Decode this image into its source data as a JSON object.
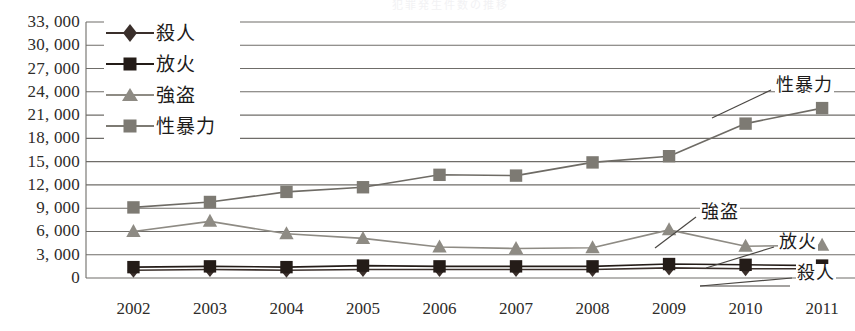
{
  "title_faint": "犯罪発生件数の推移",
  "chart_data": {
    "type": "line",
    "title": "",
    "xlabel": "",
    "ylabel": "",
    "ylim": [
      0,
      33000
    ],
    "ytick_step": 3000,
    "grid": true,
    "legend_position": "top-left",
    "categories": [
      "2002",
      "2003",
      "2004",
      "2005",
      "2006",
      "2007",
      "2008",
      "2009",
      "2010",
      "2011"
    ],
    "ytick_labels": [
      "33, 000",
      "30, 000",
      "27, 000",
      "24, 000",
      "21, 000",
      "18, 000",
      "15, 000",
      "12, 000",
      "9, 000",
      "6, 000",
      "3, 000",
      "0"
    ],
    "ytick_values": [
      33000,
      30000,
      27000,
      24000,
      21000,
      18000,
      15000,
      12000,
      9000,
      6000,
      3000,
      0
    ],
    "series": [
      {
        "name": "殺人",
        "marker": "diamond",
        "color": "#3a2f2b",
        "line_color": "#3a2f2b",
        "values": [
          1000,
          1100,
          1000,
          1100,
          1100,
          1100,
          1100,
          1300,
          1200,
          1200
        ]
      },
      {
        "name": "放火",
        "marker": "square",
        "color": "#241c18",
        "line_color": "#241c18",
        "values": [
          1400,
          1500,
          1400,
          1600,
          1500,
          1500,
          1500,
          1800,
          1700,
          1600
        ]
      },
      {
        "name": "強盗",
        "marker": "triangle",
        "color": "#8e8b84",
        "line_color": "#8e8b84",
        "values": [
          6000,
          7300,
          5700,
          5100,
          4000,
          3800,
          3900,
          6200,
          4100,
          4200
        ]
      },
      {
        "name": "性暴力",
        "marker": "square",
        "color": "#7d7a73",
        "line_color": "#6e6b65",
        "values": [
          9100,
          9800,
          11100,
          11700,
          13300,
          13200,
          14900,
          15700,
          19900,
          21900
        ]
      }
    ],
    "annotations": [
      {
        "text": "性暴力",
        "series": "性暴力"
      },
      {
        "text": "強盗",
        "series": "強盗"
      },
      {
        "text": "放火",
        "series": "放火"
      },
      {
        "text": "殺人",
        "series": "殺人"
      }
    ]
  },
  "legend": {
    "items": [
      {
        "label": "殺人",
        "marker": "diamond",
        "color": "#3a2f2b"
      },
      {
        "label": "放火",
        "marker": "square",
        "color": "#241c18"
      },
      {
        "label": "強盗",
        "marker": "triangle",
        "color": "#8e8b84"
      },
      {
        "label": "性暴力",
        "marker": "square",
        "color": "#7d7a73"
      }
    ]
  },
  "style": {
    "grid_color": "#6f6d69",
    "background": "#ffffff",
    "text_color": "#2e2c2a"
  }
}
